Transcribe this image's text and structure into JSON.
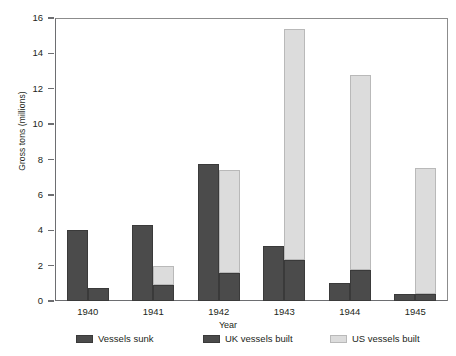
{
  "chart_data": {
    "type": "bar",
    "title": "",
    "subtitle": "",
    "xlabel": "Year",
    "ylabel": "Gross tons (millions)",
    "categories": [
      "1940",
      "1941",
      "1942",
      "1943",
      "1944",
      "1945"
    ],
    "ylim": [
      0,
      16
    ],
    "yticks": [
      0,
      2,
      4,
      6,
      8,
      10,
      12,
      14,
      16
    ],
    "ytick_labels": [
      "0",
      "2",
      "4",
      "6",
      "8",
      "10",
      "12",
      "14",
      "16"
    ],
    "grid": false,
    "legend_position": "bottom",
    "stacked_second_bar": true,
    "series": [
      {
        "name": "Vessels sunk",
        "color": "#4b4b4b",
        "values": [
          4.0,
          4.3,
          7.75,
          3.1,
          1.0,
          0.4
        ]
      },
      {
        "name": "UK vessels built",
        "color": "#4b4b4b",
        "values": [
          0.75,
          0.9,
          1.6,
          2.3,
          1.75,
          0.4
        ]
      },
      {
        "name": "US vessels built",
        "color": "#dcdcdc",
        "values": [
          0.0,
          1.1,
          5.8,
          13.1,
          11.05,
          7.1
        ]
      }
    ],
    "stacked_totals_built": [
      0.75,
      2.0,
      7.4,
      15.4,
      12.8,
      7.5
    ],
    "colors": {
      "dark": "#4b4b4b",
      "dark_edge": "#3a3a3a",
      "light": "#dcdcdc",
      "light_edge": "#b9b9b9",
      "axis": "#6d6e71",
      "text": "#231f20",
      "background": "#ffffff"
    },
    "legend": [
      {
        "label": "Vessels sunk",
        "color": "#4b4b4b"
      },
      {
        "label": "UK vessels built",
        "color": "#4b4b4b"
      },
      {
        "label": "US vessels built",
        "color": "#dcdcdc"
      }
    ]
  }
}
